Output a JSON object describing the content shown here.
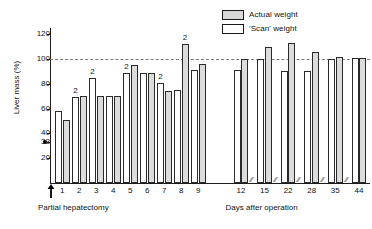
{
  "chart_data": {
    "type": "bar",
    "title": "",
    "subtitle": "",
    "xlabel": "Days after operation",
    "ylabel": "Liver mass (%)",
    "ylim": [
      0,
      125
    ],
    "yticks": [
      20,
      33,
      40,
      60,
      80,
      100,
      120
    ],
    "ytick_labels": [
      "20",
      "33",
      "40",
      "60",
      "80",
      "100",
      "120"
    ],
    "grid": false,
    "reference_line": {
      "y": 100,
      "style": "dashed",
      "label": ""
    },
    "marker_33": {
      "value": 33,
      "symbol": "filled-circle",
      "meaning": "residual liver mass immediately after partial hepatectomy"
    },
    "legend_position": "top-right",
    "categories": [
      "1",
      "2",
      "3",
      "4",
      "5",
      "6",
      "7",
      "8",
      "9",
      "12",
      "15",
      "22",
      "28",
      "35",
      "44"
    ],
    "series": [
      {
        "name": "'Scan' weight",
        "fill": "open",
        "values": [
          58,
          69,
          85,
          70,
          89,
          89,
          81,
          75,
          91,
          91,
          100,
          90,
          90,
          100,
          101
        ]
      },
      {
        "name": "Actual weight",
        "fill": "stippled",
        "values": [
          51,
          70,
          70,
          70,
          95,
          89,
          74,
          112,
          96,
          100,
          110,
          113,
          106,
          102,
          101
        ]
      }
    ],
    "annotations": [
      {
        "category": "2",
        "text": "2",
        "above": "scan"
      },
      {
        "category": "3",
        "text": "2",
        "above": "scan"
      },
      {
        "category": "5",
        "text": "2",
        "above": "scan"
      },
      {
        "category": "7",
        "text": "2",
        "above": "scan"
      },
      {
        "category": "8",
        "text": "2",
        "above": "actual"
      }
    ],
    "axis_breaks": [
      "between-9-and-12",
      "between-12-and-15",
      "between-15-and-22",
      "between-22-and-28",
      "between-28-and-35",
      "between-35-and-44"
    ],
    "origin_marker": {
      "symbol": "up-arrow",
      "label": "Partial hepatectomy"
    }
  },
  "legend": {
    "items": [
      {
        "label": "Actual weight",
        "swatch": "stippled-square"
      },
      {
        "label": "'Scan' weight",
        "swatch": "open-square"
      }
    ]
  },
  "axes": {
    "y_title": "Liver mass (%)",
    "y_ticks": [
      "120",
      "100",
      "80",
      "60",
      "40",
      "33",
      "20"
    ],
    "x_ticks": [
      "1",
      "2",
      "3",
      "4",
      "5",
      "6",
      "7",
      "8",
      "9",
      "12",
      "15",
      "22",
      "28",
      "35",
      "44"
    ],
    "x_caption_left": "Partial hepatectomy",
    "x_caption_right": "Days after operation",
    "break_glyph": "//"
  },
  "colors": {
    "axis": "#1d1d1d",
    "bar_outline": "#2a2a2a",
    "actual_fill": "#dcdcdc",
    "scan_fill": "#ffffff",
    "reference_line": "#7a7a7a",
    "text": "#111111"
  }
}
